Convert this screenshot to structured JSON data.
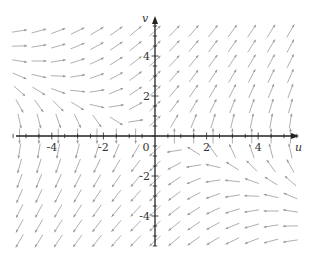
{
  "chart_data": {
    "type": "vector_field",
    "title": "",
    "xlabel": "u",
    "ylabel": "v",
    "xlim": [
      -5.5,
      5.5
    ],
    "ylim": [
      -5.5,
      5.5
    ],
    "x_ticks": [
      -4,
      -2,
      0,
      2,
      4
    ],
    "y_ticks": [
      -4,
      -2,
      2,
      4
    ],
    "x_tick_labels": [
      "-4",
      "-2",
      "0",
      "2",
      "4"
    ],
    "y_tick_labels": [
      "-4",
      "-2",
      "2",
      "4"
    ],
    "minor_tick_step": 0.5,
    "field": {
      "du": "v",
      "dv": "u + 1.2*v"
    },
    "grid_step": 0.75,
    "grid_range": [
      -5.25,
      5.25
    ],
    "grid": false,
    "arrow_color": "#9a9a9a",
    "axis_color": "#222222"
  },
  "layout": {
    "origin_px": [
      155,
      136
    ],
    "px_per_unit_x": 25.8,
    "px_per_unit_y": 20.0
  }
}
